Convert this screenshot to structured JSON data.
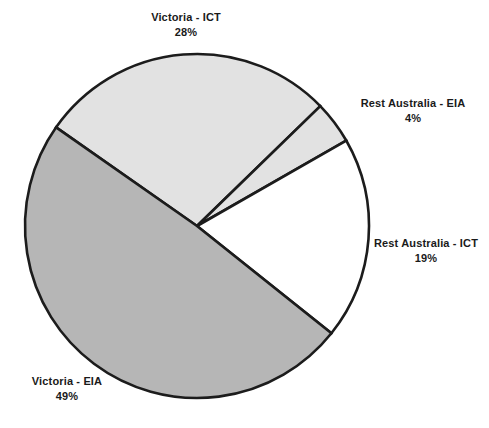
{
  "chart_data": {
    "type": "pie",
    "title": "",
    "subtitle": "",
    "xlabel": "",
    "ylabel": "",
    "legend_position": "none",
    "grid": false,
    "labels_inline": true,
    "total_percent": 100,
    "categories": [
      "Victoria - ICT",
      "Rest Australia - EIA",
      "Rest Australia - ICT",
      "Victoria - EIA"
    ],
    "values": [
      28,
      4,
      19,
      49
    ],
    "value_suffix": "%",
    "slices": [
      {
        "label": "Victoria - ICT",
        "value": 28,
        "value_text": "28%",
        "color": "#e2e2e2",
        "start_angle": 215.0,
        "sweep": 100.8
      },
      {
        "label": "Rest Australia - EIA",
        "value": 4,
        "value_text": "4%",
        "color": "#e2e2e2",
        "start_angle": 315.8,
        "sweep": 14.4
      },
      {
        "label": "Rest Australia - ICT",
        "value": 19,
        "value_text": "19%",
        "color": "#ffffff",
        "start_angle": 330.2,
        "sweep": 68.4
      },
      {
        "label": "Victoria - EIA",
        "value": 49,
        "value_text": "49%",
        "color": "#b6b6b6",
        "start_angle": 38.6,
        "sweep": 176.4
      }
    ],
    "geometry": {
      "center_x": 197,
      "center_y": 226,
      "radius": 172,
      "outline_color": "#1c1c1c",
      "outline_width": 2.6,
      "background": "#ffffff"
    }
  },
  "labels": {
    "victoria_ict": {
      "name": "Victoria - ICT",
      "value": "28%"
    },
    "rest_australia_eia": {
      "name": "Rest Australia - EIA",
      "value": "4%"
    },
    "rest_australia_ict": {
      "name": "Rest Australia - ICT",
      "value": "19%"
    },
    "victoria_eia": {
      "name": "Victoria - EIA",
      "value": "49%"
    }
  }
}
